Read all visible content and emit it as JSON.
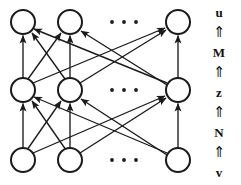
{
  "figure": {
    "background_color": "#ffffff",
    "stroke_color": "#1a1a1a",
    "node_fill": "#ffffff",
    "width": 241,
    "height": 185
  },
  "network": {
    "layers": [
      {
        "name": "output-layer",
        "variable": "u",
        "row_y": 22,
        "nodes": [
          {
            "id": "u1",
            "cx": 23,
            "cy": 22,
            "r": 12
          },
          {
            "id": "u2",
            "cx": 70,
            "cy": 22,
            "r": 12
          },
          {
            "id": "uN",
            "cx": 178,
            "cy": 22,
            "r": 12
          }
        ],
        "ellipsis": {
          "cx": 124,
          "cy": 22,
          "dots": 3
        }
      },
      {
        "name": "hidden-layer",
        "variable": "z",
        "row_y": 90,
        "nodes": [
          {
            "id": "z1",
            "cx": 23,
            "cy": 90,
            "r": 12
          },
          {
            "id": "z2",
            "cx": 70,
            "cy": 90,
            "r": 12
          },
          {
            "id": "zN",
            "cx": 178,
            "cy": 90,
            "r": 12
          }
        ],
        "ellipsis": {
          "cx": 124,
          "cy": 90,
          "dots": 3
        }
      },
      {
        "name": "input-layer",
        "variable": "v",
        "row_y": 160,
        "nodes": [
          {
            "id": "v1",
            "cx": 23,
            "cy": 160,
            "r": 12
          },
          {
            "id": "v2",
            "cx": 70,
            "cy": 160,
            "r": 12
          },
          {
            "id": "vN",
            "cx": 178,
            "cy": 160,
            "r": 12
          }
        ],
        "ellipsis": {
          "cx": 124,
          "cy": 160,
          "dots": 3
        }
      }
    ],
    "connections": [
      {
        "from_layer": "input-layer",
        "to_layer": "hidden-layer",
        "weight_matrix": "N",
        "fully_connected": true,
        "directed": true,
        "direction": "upward"
      },
      {
        "from_layer": "hidden-layer",
        "to_layer": "output-layer",
        "weight_matrix": "M",
        "fully_connected": true,
        "directed": true,
        "direction": "upward"
      }
    ]
  },
  "label_column": {
    "items": [
      {
        "key": "u",
        "text": "u",
        "kind": "variable"
      },
      {
        "key": "arrow-m",
        "text": "⇑",
        "kind": "arrow"
      },
      {
        "key": "M",
        "text": "M",
        "kind": "variable"
      },
      {
        "key": "arrow-z",
        "text": "⇑",
        "kind": "arrow"
      },
      {
        "key": "z",
        "text": "z",
        "kind": "variable"
      },
      {
        "key": "arrow-n",
        "text": "⇑",
        "kind": "arrow"
      },
      {
        "key": "N",
        "text": "N",
        "kind": "variable"
      },
      {
        "key": "arrow-v",
        "text": "⇑",
        "kind": "arrow"
      },
      {
        "key": "v",
        "text": "v",
        "kind": "variable"
      }
    ]
  }
}
